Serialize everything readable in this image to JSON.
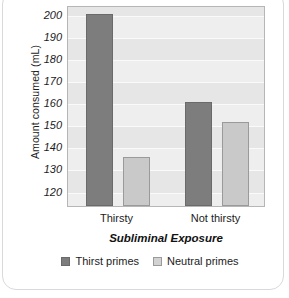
{
  "chart_data": {
    "type": "bar",
    "title": "",
    "xlabel": "Subliminal Exposure",
    "ylabel": "Amount consumed (mL)",
    "categories": [
      "Thirsty",
      "Not thirsty"
    ],
    "series": [
      {
        "name": "Thirst primes",
        "values": [
          200,
          160
        ],
        "color": "#7d7d7d"
      },
      {
        "name": "Neutral primes",
        "values": [
          135,
          151
        ],
        "color": "#c9c9c9"
      }
    ],
    "ylim": [
      113,
      204
    ],
    "yticks": [
      120,
      130,
      140,
      150,
      160,
      170,
      180,
      190,
      200
    ],
    "grid": true,
    "legend_position": "bottom"
  },
  "legend": {
    "items": [
      {
        "label": "Thirst primes"
      },
      {
        "label": "Neutral primes"
      }
    ]
  }
}
